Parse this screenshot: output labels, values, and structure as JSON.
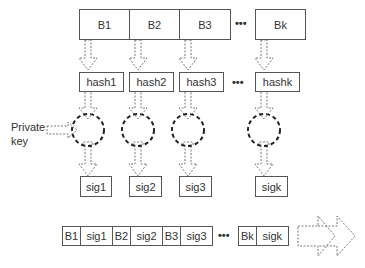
{
  "blocks": {
    "labels": [
      "B1",
      "B2",
      "B3",
      "Bk"
    ],
    "ellipsis": "•••"
  },
  "hashes": {
    "labels": [
      "hash1",
      "hash2",
      "hash3",
      "hashk"
    ],
    "ellipsis": "•••"
  },
  "signatures": {
    "labels": [
      "sig1",
      "sig2",
      "sig3",
      "sigk"
    ]
  },
  "private_key": {
    "label_line1": "Private",
    "label_line2": "key"
  },
  "output_chain": {
    "cells": [
      "B1",
      "sig1",
      "B2",
      "sig2",
      "B3",
      "sig3"
    ],
    "tail_cells": [
      "Bk",
      "sigk"
    ],
    "ellipsis": "•••"
  },
  "colors": {
    "stroke": "#555555",
    "dashed_stroke": "#333333",
    "background": "#ffffff"
  }
}
